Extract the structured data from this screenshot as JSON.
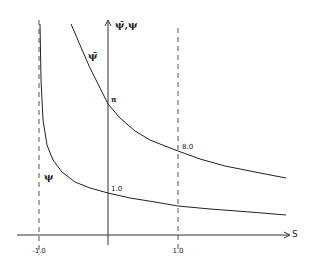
{
  "chart_data": {
    "type": "line",
    "title": "",
    "xlabel": "S",
    "ylabel": "ψ̄, ψ",
    "axis_x_label": "S",
    "axis_y_label": "ψ̄,ψ",
    "x_ticks": [
      {
        "value": -1.0,
        "label": "-1.0"
      },
      {
        "value": 1.0,
        "label": "1.0"
      }
    ],
    "asymptotes": [
      {
        "x": -1.0,
        "style": "dashed"
      },
      {
        "x": 1.0,
        "style": "dashed"
      }
    ],
    "grid": false,
    "legend": "none (curves labeled inline)",
    "series": [
      {
        "name": "ψ̄",
        "label": "ψ̄",
        "annotations": [
          {
            "x": 0,
            "label": "π"
          },
          {
            "x": 1.0,
            "label": "8.0"
          }
        ],
        "points_px": [
          [
            71,
            24
          ],
          [
            80,
            45
          ],
          [
            90,
            68
          ],
          [
            100,
            88
          ],
          [
            108,
            104
          ],
          [
            120,
            118
          ],
          [
            135,
            131
          ],
          [
            150,
            140
          ],
          [
            165,
            146
          ],
          [
            178,
            151
          ],
          [
            200,
            159
          ],
          [
            225,
            166
          ],
          [
            255,
            172
          ],
          [
            286,
            178
          ]
        ]
      },
      {
        "name": "ψ",
        "label": "ψ",
        "annotations": [
          {
            "x": 0,
            "label": "1.0"
          }
        ],
        "points_px": [
          [
            40,
            24
          ],
          [
            41,
            80
          ],
          [
            43,
            120
          ],
          [
            47,
            145
          ],
          [
            53,
            160
          ],
          [
            62,
            172
          ],
          [
            75,
            182
          ],
          [
            90,
            188
          ],
          [
            108,
            193
          ],
          [
            130,
            198
          ],
          [
            155,
            202
          ],
          [
            178,
            206
          ],
          [
            210,
            209
          ],
          [
            250,
            212
          ],
          [
            286,
            215
          ]
        ]
      }
    ]
  },
  "labels": {
    "y_axis": "ψ̄,ψ",
    "x_axis": "S",
    "curve_upper": "ψ̄",
    "curve_lower": "ψ",
    "upper_at_zero": "π",
    "upper_at_one": "8.0",
    "lower_at_zero": "1.0",
    "tick_neg_one": "-1.0",
    "tick_pos_one": "1.0"
  }
}
